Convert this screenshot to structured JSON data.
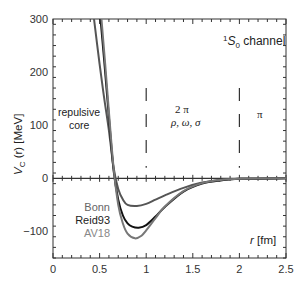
{
  "chart_data": {
    "type": "line",
    "title": "",
    "xlabel": "r [fm]",
    "ylabel": "V_C (r) [MeV]",
    "xlim": [
      0,
      2.5
    ],
    "ylim": [
      -150,
      300
    ],
    "xticks": [
      0,
      0.5,
      1,
      1.5,
      2,
      2.5
    ],
    "xtick_labels": [
      "0",
      "0.5",
      "1",
      "1.5",
      "2",
      "2.5"
    ],
    "yticks": [
      -100,
      0,
      100,
      200,
      300
    ],
    "ytick_labels": [
      "−100",
      "0",
      "100",
      "200",
      "300"
    ],
    "grid": false,
    "legend_position": "lower-left (inside, below zero line)",
    "series": [
      {
        "name": "Bonn",
        "color": "#555555",
        "x": [
          0.44,
          0.5,
          0.55,
          0.6,
          0.65,
          0.7,
          0.75,
          0.8,
          0.9,
          1.0,
          1.1,
          1.2,
          1.4,
          1.6,
          1.8,
          2.0,
          2.5
        ],
        "y": [
          300,
          215,
          150,
          90,
          20,
          -20,
          -40,
          -50,
          -52,
          -48,
          -40,
          -32,
          -18,
          -8,
          -3,
          -1,
          0
        ]
      },
      {
        "name": "Reid93",
        "color": "#111111",
        "x": [
          0.51,
          0.55,
          0.6,
          0.65,
          0.7,
          0.75,
          0.8,
          0.85,
          0.92,
          1.0,
          1.1,
          1.2,
          1.4,
          1.6,
          1.8,
          2.0,
          2.5
        ],
        "y": [
          300,
          220,
          115,
          15,
          -40,
          -70,
          -85,
          -91,
          -93,
          -88,
          -72,
          -54,
          -25,
          -10,
          -4,
          -1,
          0
        ]
      },
      {
        "name": "AV18",
        "color": "#777777",
        "x": [
          0.52,
          0.56,
          0.6,
          0.65,
          0.7,
          0.75,
          0.8,
          0.88,
          0.95,
          1.0,
          1.1,
          1.2,
          1.4,
          1.6,
          1.8,
          2.0,
          2.5
        ],
        "y": [
          300,
          215,
          125,
          20,
          -50,
          -85,
          -104,
          -113,
          -108,
          -98,
          -75,
          -53,
          -24,
          -9,
          -3,
          -1,
          0
        ]
      }
    ],
    "reference_lines": [
      {
        "type": "vertical-dashed",
        "x": 1.0,
        "y_range": [
          20,
          170
        ]
      },
      {
        "type": "vertical-dashed",
        "x": 2.0,
        "y_range": [
          20,
          170
        ]
      },
      {
        "type": "horizontal",
        "y": 0
      }
    ],
    "annotations": [
      {
        "text": "¹S₀ channel",
        "near": "top-right"
      },
      {
        "text": "repulsive core",
        "region": "r < 1"
      },
      {
        "text": "2 π / ρ, ω, σ",
        "region": "1 < r < 2"
      },
      {
        "text": "π",
        "region": "r > 2"
      }
    ]
  },
  "labels": {
    "channel_sup": "1",
    "channel_S": "S",
    "channel_sub": "0",
    "channel_rest": " channel",
    "repulsive": "repulsive",
    "core": "core",
    "two_pi": "2 π",
    "mesons": "ρ, ω, σ",
    "pi": "π",
    "ylabel_V": "V",
    "ylabel_sub": "C",
    "ylabel_rest": " (r) [MeV]",
    "xlabel_r": "r",
    "xlabel_rest": " [fm]"
  }
}
